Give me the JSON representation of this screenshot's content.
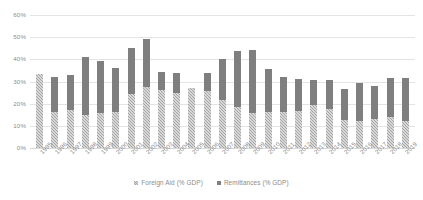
{
  "chart_data": {
    "type": "bar",
    "stacked": true,
    "title": "",
    "subtitle": "",
    "xlabel": "",
    "ylabel": "",
    "ylim": [
      0,
      60
    ],
    "y_tick_labels": [
      "0%",
      "10%",
      "20%",
      "30%",
      "40%",
      "50%",
      "60%"
    ],
    "y_tick_values": [
      0,
      10,
      20,
      30,
      40,
      50,
      60
    ],
    "grid": true,
    "legend_position": "bottom",
    "categories": [
      "1995",
      "1996",
      "1997",
      "1998",
      "1999",
      "2000",
      "2001",
      "2002",
      "2003",
      "2004",
      "2005",
      "2006",
      "2007",
      "2008",
      "2009",
      "2010",
      "2011",
      "2012",
      "2013",
      "2014",
      "2015",
      "2016",
      "2017",
      "2018",
      "2019"
    ],
    "series": [
      {
        "name": "Foreign Aid (% GDP)",
        "color": "#a6a6a6",
        "pattern": "checkered",
        "values": [
          33.3,
          16.3,
          17.0,
          14.8,
          15.7,
          16.1,
          24.5,
          27.5,
          26.3,
          25.0,
          27.2,
          25.5,
          21.5,
          18.3,
          16.0,
          16.4,
          16.4,
          16.7,
          19.5,
          17.8,
          12.5,
          12.0,
          13.2,
          14.0,
          12.0
        ]
      },
      {
        "name": "Remittances  (% GDP)",
        "color": "#7f7f7f",
        "pattern": "solid",
        "values": [
          0.0,
          15.8,
          15.8,
          26.1,
          23.4,
          19.8,
          20.5,
          21.5,
          7.8,
          8.9,
          0.0,
          8.5,
          18.5,
          25.6,
          28.1,
          19.1,
          15.7,
          14.3,
          11.0,
          13.0,
          14.0,
          17.2,
          14.9,
          17.5,
          19.5
        ]
      }
    ],
    "totals": [
      33.3,
      32.1,
      32.8,
      40.9,
      39.1,
      35.9,
      45.0,
      49.0,
      34.1,
      33.9,
      27.2,
      34.0,
      40.0,
      43.9,
      44.1,
      35.5,
      32.1,
      31.0,
      30.5,
      30.8,
      26.5,
      29.2,
      28.1,
      31.5,
      31.5
    ]
  },
  "legend": {
    "items": [
      {
        "label": "Foreign Aid (% GDP)",
        "swatch": "aid"
      },
      {
        "label": "Remittances  (% GDP)",
        "swatch": "remit"
      }
    ]
  },
  "colors": {
    "foreign_aid": "#a6a6a6",
    "remittances": "#7f7f7f",
    "gridline": "#e4e4e4",
    "text": "#8c8c8c",
    "background": "#ffffff"
  }
}
